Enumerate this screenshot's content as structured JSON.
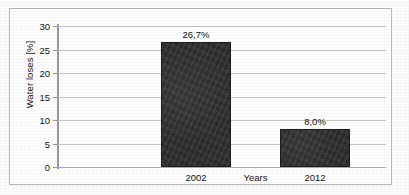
{
  "chart_data": {
    "type": "bar",
    "title": "",
    "categories": [
      "2002",
      "2012"
    ],
    "values": [
      26.7,
      8.0
    ],
    "data_labels": [
      "26,7%",
      "8,0%"
    ],
    "xlabel": "Years",
    "ylabel": "Water loses [%]",
    "ylim": [
      0,
      30
    ],
    "yticks": [
      0,
      5,
      10,
      15,
      20,
      25,
      30
    ],
    "ytick_labels": [
      "0",
      "5",
      "10",
      "15",
      "20",
      "25",
      "30"
    ],
    "grid": true,
    "legend": null,
    "legend_position": "none",
    "series": [
      {
        "name": "Water loses",
        "values": [
          26.7,
          8.0
        ],
        "color": "#2b2b2b"
      }
    ]
  },
  "colors": {
    "bar_fill": "#2b2b2b",
    "gridline": "#c4c4c4",
    "axis": "#9a9a9a",
    "frame_border": "#b9b9b9",
    "plot_background": "#ffffff",
    "text": "#141414"
  }
}
